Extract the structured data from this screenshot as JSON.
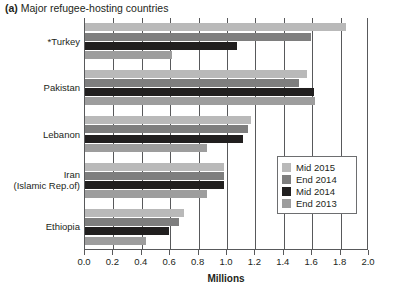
{
  "figure": {
    "label": "(a)",
    "title": "Major refugee-hosting countries",
    "full_title": "(a) Major refugee-hosting countries"
  },
  "axis": {
    "x_title": "Millions",
    "x_ticks": [
      "0.0",
      "0.2",
      "0.4",
      "0.6",
      "0.8",
      "1.0",
      "1.2",
      "1.4",
      "1.6",
      "1.8",
      "2.0"
    ]
  },
  "legend": {
    "position": "inside-right-middle",
    "items": [
      {
        "label": "Mid 2015",
        "color": "#b9b9b9"
      },
      {
        "label": "End 2014",
        "color": "#7e7e7e"
      },
      {
        "label": "Mid 2014",
        "color": "#211f1f"
      },
      {
        "label": "End 2013",
        "color": "#9d9d9d"
      }
    ]
  },
  "chart_data": {
    "type": "bar",
    "orientation": "horizontal",
    "title": "(a) Major refugee-hosting countries",
    "xlabel": "Millions",
    "ylabel": "",
    "xlim": [
      0.0,
      2.0
    ],
    "xticks": [
      0.0,
      0.2,
      0.4,
      0.6,
      0.8,
      1.0,
      1.2,
      1.4,
      1.6,
      1.8,
      2.0
    ],
    "grid": "vertical",
    "legend_position": "center right inside",
    "categories": [
      "*Turkey",
      "Pakistan",
      "Lebanon",
      "Iran (Islamic Rep.of)",
      "Ethiopia"
    ],
    "series": [
      {
        "name": "Mid 2015",
        "color": "#b9b9b9",
        "values": [
          1.84,
          1.56,
          1.17,
          0.98,
          0.7
        ]
      },
      {
        "name": "End 2014",
        "color": "#7e7e7e",
        "values": [
          1.59,
          1.51,
          1.15,
          0.98,
          0.66
        ]
      },
      {
        "name": "Mid 2014",
        "color": "#211f1f",
        "values": [
          1.07,
          1.61,
          1.11,
          0.98,
          0.59
        ]
      },
      {
        "name": "End 2013",
        "color": "#9d9d9d",
        "values": [
          0.61,
          1.62,
          0.86,
          0.86,
          0.43
        ]
      }
    ]
  },
  "categories_display": [
    {
      "lines": [
        "*Turkey"
      ]
    },
    {
      "lines": [
        "Pakistan"
      ]
    },
    {
      "lines": [
        "Lebanon"
      ]
    },
    {
      "lines": [
        "Iran",
        "(Islamic Rep.of)"
      ]
    },
    {
      "lines": [
        "Ethiopia"
      ]
    }
  ]
}
